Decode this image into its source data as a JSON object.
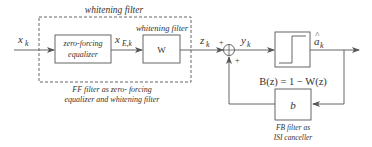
{
  "diagram": {
    "type": "block-diagram",
    "group_label": "whitening filter",
    "group_caption_line1": "FF filter as zero- forcing",
    "group_caption_line2": "equalizer and whitening filter",
    "input_signal": "x",
    "input_sub": "k",
    "blocks": {
      "zero_forcing": {
        "line1": "zero-forcing",
        "line2": "equalizer"
      },
      "whitening": {
        "title": "whitening filter",
        "label": "W"
      },
      "decision": {
        "label": "slicer"
      },
      "feedback": {
        "label": "b",
        "caption_line1": "FB filter as",
        "caption_line2": "ISI canceller"
      }
    },
    "signals": {
      "xE": {
        "main": "x",
        "sub": "E,k"
      },
      "z": {
        "main": "z",
        "sub": "k"
      },
      "y": {
        "main": "y",
        "sub": "k"
      },
      "a_hat": {
        "main": "a",
        "hat": "^",
        "sub": "k"
      }
    },
    "summer": {
      "plus_top": "+",
      "plus_bottom": "+"
    },
    "equation": "B(z) = 1 − W(z)"
  }
}
